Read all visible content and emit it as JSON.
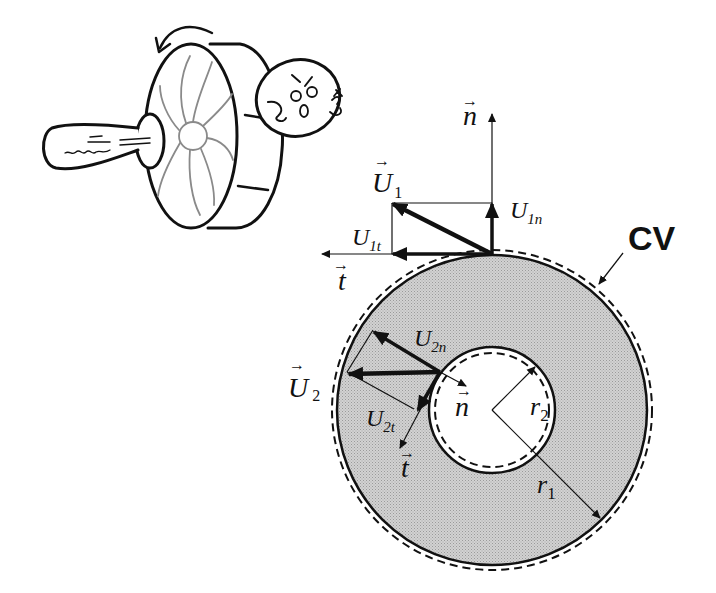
{
  "figure": {
    "illustration": {
      "description": "cartoon pump impeller with character",
      "rotation_arrow": "counterclockwise"
    },
    "control_volume_label": "CV",
    "outer_inlet": {
      "velocity_label": "U",
      "velocity_subscript": "1",
      "normal_component_label": "U",
      "normal_component_subscript": "1n",
      "tangential_component_label": "U",
      "tangential_component_subscript": "1t",
      "normal_vector_label": "n",
      "tangent_vector_label": "t"
    },
    "inner_outlet": {
      "velocity_label": "U",
      "velocity_subscript": "2",
      "normal_component_label": "U",
      "normal_component_subscript": "2n",
      "tangential_component_label": "U",
      "tangential_component_subscript": "2t",
      "normal_vector_label": "n",
      "tangent_vector_label": "t"
    },
    "radii": {
      "outer_label": "r",
      "outer_subscript": "1",
      "inner_label": "r",
      "inner_subscript": "2"
    },
    "colors": {
      "annulus_fill": "#c8c8c8",
      "stroke": "#111111",
      "background": "#ffffff"
    }
  }
}
